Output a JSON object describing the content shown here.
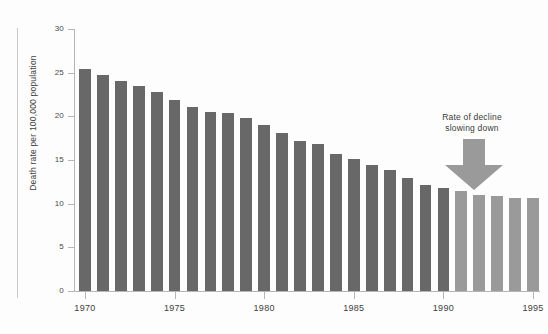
{
  "chart_data": {
    "type": "bar",
    "title": "",
    "subtitle": "",
    "xlabel": "",
    "ylabel": "Death rate per 100,000 population",
    "ylim": [
      0,
      30
    ],
    "ytick_values": [
      0,
      5,
      10,
      15,
      20,
      25,
      30
    ],
    "ytick_labels": [
      "0",
      "5",
      "10",
      "15",
      "20",
      "25",
      "30"
    ],
    "xtick_labels": [
      "1970",
      "1975",
      "1980",
      "1985",
      "1990",
      "1995"
    ],
    "grid": false,
    "legend": "none",
    "categories": [
      "1970",
      "1971",
      "1972",
      "1973",
      "1974",
      "1975",
      "1976",
      "1977",
      "1978",
      "1979",
      "1980",
      "1981",
      "1982",
      "1983",
      "1984",
      "1985",
      "1986",
      "1987",
      "1988",
      "1989",
      "1990",
      "1991",
      "1992",
      "1993",
      "1994",
      "1995"
    ],
    "values": [
      25.4,
      24.7,
      24.1,
      23.5,
      22.8,
      21.9,
      21.1,
      20.5,
      20.4,
      19.8,
      19.0,
      18.1,
      17.2,
      16.8,
      15.7,
      15.1,
      14.4,
      13.9,
      12.9,
      12.1,
      11.8,
      11.4,
      11.0,
      10.9,
      10.7,
      10.6
    ],
    "series_styles": [
      {
        "name": "Observed",
        "color": "#686868",
        "categories_from": "1970",
        "categories_to": "1990"
      },
      {
        "name": "Recent",
        "color": "#9a9a9a",
        "categories_from": "1991",
        "categories_to": "1995"
      }
    ],
    "annotations": [
      {
        "name": "rate-of-decline-note",
        "text_line1": "Rate of decline",
        "text_line2": "slowing down",
        "marker": "down-arrow",
        "marker_color": "#9a9a9a"
      }
    ],
    "colors": {
      "bar_dark": "#686868",
      "bar_light": "#9a9a9a",
      "axis": "#b5b5b5",
      "text": "#3f3f3f",
      "background": "#fdfdfd"
    }
  }
}
